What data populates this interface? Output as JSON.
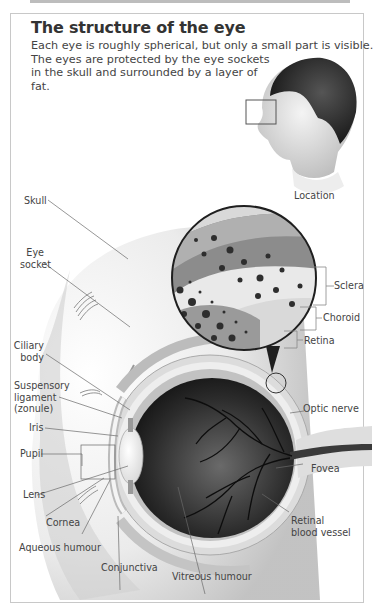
{
  "title": "The structure of the eye",
  "intro": {
    "lines": [
      "Each eye is roughly spherical, but only a small part is visible.",
      "The eyes are protected by the eye sockets",
      "in the skull and surrounded by a layer of",
      "fat."
    ]
  },
  "location_inset": {
    "caption": "Location"
  },
  "magnified_inset": {
    "labels": {
      "sclera": "Sclera",
      "choroid": "Choroid",
      "retina": "Retina"
    }
  },
  "labels": {
    "skull": "Skull",
    "eye_socket": [
      "Eye",
      "socket"
    ],
    "ciliary_body": [
      "Ciliary",
      "body"
    ],
    "suspensory_ligament": [
      "Suspensory",
      "ligament",
      "(zonule)"
    ],
    "iris": "Iris",
    "pupil": "Pupil",
    "lens": "Lens",
    "cornea": "Cornea",
    "aqueous_humour": "Aqueous humour",
    "conjunctiva": "Conjunctiva",
    "vitreous_humour": "Vitreous humour",
    "optic_nerve": "Optic nerve",
    "fovea": "Fovea",
    "retinal_blood_vessel": [
      "Retinal",
      "blood vessel"
    ]
  }
}
